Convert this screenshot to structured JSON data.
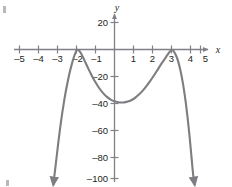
{
  "chart_data": {
    "type": "line",
    "title": "",
    "subtitle": "",
    "xlabel": "x",
    "ylabel": "y",
    "xlim": [
      -5.6,
      5.6
    ],
    "ylim": [
      -106,
      26
    ],
    "grid": false,
    "legend": null,
    "annotations": [],
    "x_ticks": [
      -5,
      -4,
      -3,
      -2,
      -1,
      1,
      2,
      3,
      4,
      5
    ],
    "x_tick_labels": [
      "–5",
      "–4",
      "–3",
      "–2",
      "–1",
      "1",
      "2",
      "3",
      "4",
      "5"
    ],
    "y_ticks": [
      20,
      -20,
      -40,
      -60,
      -80,
      -100
    ],
    "y_tick_labels": [
      "20",
      "–20",
      "–40",
      "–60",
      "–80",
      "–100"
    ],
    "series": [
      {
        "name": "quartic curve",
        "color": "#7d7d82",
        "roots": [
          -2,
          3
        ],
        "root_multiplicity": 2,
        "local_maxima": [
          [
            -2,
            0
          ],
          [
            3,
            0
          ]
        ],
        "local_minima": [
          [
            0.5,
            -39
          ]
        ],
        "end_behavior": "both ends go to negative infinity",
        "arrow_start": [
          -3.22,
          -100
        ],
        "arrow_end": [
          4.22,
          -100
        ],
        "points": [
          [
            -3.22,
            -100
          ],
          [
            -3.15,
            -92
          ],
          [
            -3.05,
            -80
          ],
          [
            -2.95,
            -68
          ],
          [
            -2.85,
            -57
          ],
          [
            -2.75,
            -47
          ],
          [
            -2.65,
            -38
          ],
          [
            -2.55,
            -30
          ],
          [
            -2.45,
            -23
          ],
          [
            -2.35,
            -16.5
          ],
          [
            -2.25,
            -11
          ],
          [
            -2.15,
            -6.2
          ],
          [
            -2.05,
            -2.4
          ],
          [
            -2.0,
            -0.6
          ],
          [
            -1.95,
            -0.2
          ],
          [
            -1.85,
            -1.1
          ],
          [
            -1.75,
            -3.2
          ],
          [
            -1.6,
            -7.5
          ],
          [
            -1.4,
            -13.5
          ],
          [
            -1.2,
            -19.2
          ],
          [
            -1.0,
            -24.3
          ],
          [
            -0.8,
            -28.7
          ],
          [
            -0.6,
            -32.3
          ],
          [
            -0.4,
            -35.1
          ],
          [
            -0.2,
            -37.1
          ],
          [
            0.0,
            -38.4
          ],
          [
            0.2,
            -39.1
          ],
          [
            0.4,
            -39.3
          ],
          [
            0.5,
            -39.2
          ],
          [
            0.7,
            -38.6
          ],
          [
            0.9,
            -37.4
          ],
          [
            1.1,
            -35.6
          ],
          [
            1.3,
            -33.2
          ],
          [
            1.5,
            -30.3
          ],
          [
            1.7,
            -26.8
          ],
          [
            1.9,
            -22.9
          ],
          [
            2.1,
            -18.7
          ],
          [
            2.3,
            -14.3
          ],
          [
            2.5,
            -9.9
          ],
          [
            2.7,
            -5.8
          ],
          [
            2.85,
            -2.7
          ],
          [
            2.95,
            -0.8
          ],
          [
            3.0,
            -0.3
          ],
          [
            3.05,
            -0.4
          ],
          [
            3.15,
            -2.0
          ],
          [
            3.25,
            -4.8
          ],
          [
            3.35,
            -8.8
          ],
          [
            3.45,
            -14.2
          ],
          [
            3.55,
            -21.0
          ],
          [
            3.65,
            -29.3
          ],
          [
            3.75,
            -39.2
          ],
          [
            3.85,
            -50.8
          ],
          [
            3.95,
            -64.1
          ],
          [
            4.05,
            -79.3
          ],
          [
            4.15,
            -94.0
          ],
          [
            4.22,
            -100
          ]
        ]
      }
    ],
    "axis_color": "#808086",
    "background": "#ffffff"
  },
  "figure": {
    "x_axis_label": "x",
    "y_axis_label": "y"
  }
}
